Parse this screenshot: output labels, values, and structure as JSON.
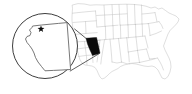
{
  "figure": {
    "type": "locator-map",
    "background_color": "#ffffff",
    "width": 192,
    "height": 94
  },
  "colors": {
    "background": "#ffffff",
    "state_border": "#b8b8b8",
    "state_fill": "#ffffff",
    "highlight_fill": "#0a0a0a",
    "callout_stroke": "#1a1a1a",
    "inset_border": "#1a1a1a",
    "inset_state_stroke": "#555555",
    "city_marker": "#0a0a0a"
  },
  "basemap": {
    "name": "united-states-contiguous",
    "highlighted_state": "Arizona",
    "highlighted_state_code": "AZ",
    "state_count": 49,
    "outline": "M 72.5 5.0 L 78.0 3.6 L 84.5 4.0 L 90.0 5.2 L 96.0 4.8 L 103.0 5.0 L 110.0 4.6 L 118.0 4.4 L 126.0 4.2 L 133.0 4.4 L 140.0 5.0 L 146.0 6.2 L 151.0 8.0 L 155.0 7.0 L 158.5 9.0 L 162.0 8.0 L 165.5 10.5 L 169.0 13.0 L 172.5 14.5 L 176.0 16.0 L 179.0 19.0 L 178.0 22.0 L 175.5 25.0 L 173.0 27.5 L 170.0 30.5 L 168.0 34.0 L 166.5 38.0 L 165.0 42.0 L 163.5 46.0 L 165.0 50.0 L 167.0 54.0 L 169.0 58.0 L 170.5 62.0 L 171.0 67.0 L 170.0 72.0 L 168.0 76.5 L 165.0 79.0 L 162.0 78.0 L 160.0 74.0 L 158.0 70.0 L 155.0 67.0 L 152.0 66.0 L 148.0 66.5 L 144.0 66.0 L 140.0 65.0 L 136.0 64.0 L 132.0 63.5 L 128.0 64.0 L 124.0 65.0 L 120.5 66.5 L 118.0 68.5 L 115.0 70.0 L 112.0 71.5 L 109.5 73.5 L 107.0 76.0 L 104.5 78.0 L 102.0 79.0 L 100.0 77.0 L 98.5 74.0 L 97.0 70.5 L 95.0 67.5 L 92.0 66.0 L 88.5 65.5 L 85.0 65.0 L 82.0 63.0 L 80.0 60.0 L 79.0 56.5 L 78.0 53.0 L 77.0 49.0 L 76.0 45.0 L 75.0 41.0 L 74.0 37.0 L 73.5 33.0 L 73.0 29.0 L 72.5 25.0 L 72.0 21.0 L 72.0 17.0 L 72.2 13.0 L 72.5 9.0 Z",
    "interior_borders": [
      "M 72.4 13.2 L 80.0 12.4 L 88.0 11.6 L 95.5 11.0",
      "M 95.5 11.0 L 96.2 19.0 L 96.8 27.0",
      "M 73.0 22.5 L 82.0 21.8 L 90.0 21.2 L 96.4 20.8",
      "M 74.0 34.5 L 82.0 33.8 L 89.0 33.2 L 97.2 32.6",
      "M 85.5 21.6 L 86.0 33.4",
      "M 75.5 42.0 L 84.0 41.4 L 92.0 40.8 L 100.0 40.2",
      "M 97.0 27.0 L 104.0 26.4 L 111.0 25.8 L 118.0 25.2",
      "M 104.0 5.2 L 104.6 15.0 L 105.0 26.4",
      "M 112.0 4.8 L 112.5 15.0 L 112.8 25.8",
      "M 119.0 4.6 L 119.5 15.0 L 120.0 25.2",
      "M 96.6 15.5 L 104.8 15.0 L 112.5 14.6 L 120.0 14.2 L 127.0 13.8",
      "M 127.0 4.4 L 127.4 13.8 L 127.8 25.0",
      "M 120.2 25.2 L 128.0 24.8 L 135.0 24.4",
      "M 134.5 4.4 L 134.8 14.0 L 135.2 24.4",
      "M 135.2 24.4 L 142.0 24.0 L 148.0 23.6",
      "M 141.5 5.0 L 141.8 14.0 L 142.0 24.0",
      "M 142.0 14.0 L 149.0 13.4 L 155.0 12.6",
      "M 97.4 40.2 L 105.0 39.6 L 112.0 39.0 L 119.0 38.4 L 126.5 37.8",
      "M 105.4 26.4 L 105.8 39.6",
      "M 113.0 25.8 L 113.4 39.0",
      "M 120.4 25.0 L 120.8 38.4",
      "M 128.0 24.8 L 128.4 37.8",
      "M 126.5 37.8 L 133.0 37.2 L 139.0 36.6 L 145.0 36.0",
      "M 135.5 24.4 L 135.9 37.0",
      "M 142.2 24.0 L 142.6 36.2",
      "M 148.5 23.6 L 149.5 30.0 L 150.0 35.5",
      "M 148.0 23.6 L 154.0 22.6 L 159.0 21.6",
      "M 155.0 12.6 L 156.0 17.0 L 157.0 21.8",
      "M 159.0 21.6 L 161.5 25.0 L 163.0 28.5",
      "M 150.0 35.5 L 156.0 33.5 L 161.5 31.0",
      "M 145.0 36.0 L 146.5 42.0 L 148.0 48.0",
      "M 126.8 37.8 L 127.5 45.0 L 128.2 52.0",
      "M 128.2 52.0 L 134.0 51.0 L 140.0 50.0 L 146.5 49.0",
      "M 136.0 37.0 L 136.8 44.0 L 137.5 50.4",
      "M 137.5 50.4 L 138.5 56.5 L 139.5 62.5",
      "M 146.5 49.0 L 148.0 54.0 L 149.5 59.0",
      "M 139.5 62.5 L 146.0 61.0 L 152.0 59.6 L 157.5 58.0",
      "M 149.5 59.0 L 155.0 58.4",
      "M 157.5 58.0 L 160.0 62.0 L 162.0 66.0 L 163.5 70.0",
      "M 128.4 52.0 L 129.0 58.0 L 129.4 63.8",
      "M 118.5 38.4 L 119.5 46.0 L 120.5 54.0 L 121.5 62.0",
      "M 121.5 62.0 L 127.0 63.8 L 133.5 63.0 L 139.8 62.4",
      "M 104.5 39.6 L 103.5 46.0 L 102.5 52.0 L 101.5 58.0 L 100.8 64.0",
      "M 110.0 39.2 L 110.8 47.0 L 111.5 55.0 L 112.0 62.0",
      "M 112.0 62.0 L 117.0 63.0 L 121.5 62.2",
      "M 100.0 40.2 L 99.0 47.5 L 98.0 55.0 L 97.0 62.0",
      "M 84.5 41.4 L 85.5 49.0 L 86.5 57.0 L 87.0 64.5",
      "M 76.5 49.0 L 84.0 48.0 L 92.0 47.0 L 99.5 46.5",
      "M 92.0 47.0 L 92.5 55.0 L 93.0 62.5",
      "M 78.5 56.5 L 85.5 55.5 L 92.7 55.0",
      "M 86.2 38.5 L 94.0 38.0"
    ],
    "highlight_shape": "M 86.0 38.2 L 95.2 37.6 L 96.6 37.5 L 98.5 46.0 L 100.0 53.2 L 96.0 54.6 L 92.5 55.6 L 89.5 49.0 L 87.5 44.0 Z"
  },
  "callout": {
    "shape": "cone",
    "lines": [
      "M 74.6 29.0 L 86.8 39.0",
      "M 70.2 71.0 L 99.2 53.6"
    ],
    "circle": {
      "center_x": 45.0,
      "center_y": 46.0,
      "radius": 32.5
    }
  },
  "inset": {
    "state_name": "Arizona",
    "outline": "M 33.0 26.0 L 41.5 25.0 L 50.0 24.2 L 58.5 23.4 L 67.0 22.6 L 67.6 30.0 L 68.2 38.0 L 68.8 46.0 L 69.4 54.0 L 70.0 62.0 L 70.6 69.5 L 62.0 70.0 L 53.5 70.4 L 45.0 70.8 L 41.5 66.5 L 38.0 62.0 L 35.5 57.5 L 34.0 53.0 L 32.0 49.0 L 29.5 45.5 L 27.0 42.5 L 25.5 39.0 L 27.0 36.5 L 30.0 35.5 L 31.0 32.5 L 29.5 30.0 L 31.5 28.0 Z",
    "city_marker": {
      "name": "Phoenix",
      "x": 41.0,
      "y": 29.0,
      "size": 3.6
    }
  }
}
